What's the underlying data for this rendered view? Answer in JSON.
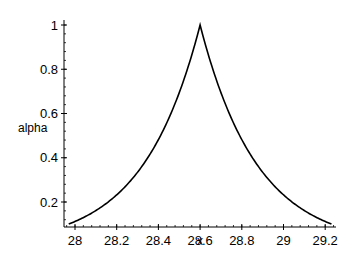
{
  "chart_data": {
    "type": "line",
    "title": "",
    "xlabel": "x",
    "ylabel": "alpha",
    "xlim": [
      27.95,
      29.25
    ],
    "ylim": [
      0.1,
      1.0
    ],
    "grid": false,
    "legend": null,
    "x_ticks": [
      28,
      28.2,
      28.4,
      28.6,
      28.8,
      29,
      29.2
    ],
    "x_tick_labels": [
      "28",
      "28.2",
      "28.4",
      "28.6",
      "28.8",
      "29",
      "29.2"
    ],
    "y_ticks": [
      0.2,
      0.4,
      0.6,
      0.8,
      1
    ],
    "y_tick_labels": [
      "0.2",
      "0.4",
      "0.6",
      "0.8",
      "1"
    ],
    "series": [
      {
        "name": "alpha",
        "color": "#000000",
        "x": [
          27.97,
          28.0,
          28.1,
          28.2,
          28.3,
          28.4,
          28.5,
          28.6,
          28.7,
          28.8,
          28.9,
          29.0,
          29.1,
          29.2,
          29.23
        ],
        "y": [
          0.1,
          0.11,
          0.16,
          0.23,
          0.33,
          0.48,
          0.69,
          1.0,
          0.69,
          0.48,
          0.33,
          0.23,
          0.16,
          0.11,
          0.1
        ]
      }
    ],
    "annotations": []
  }
}
